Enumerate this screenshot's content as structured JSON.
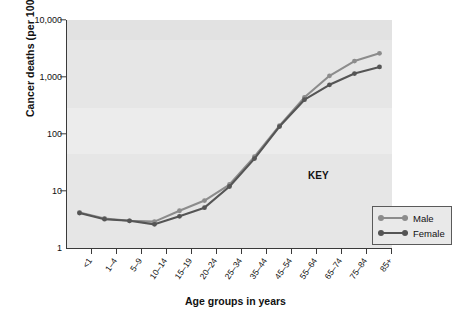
{
  "chart_data": {
    "type": "line",
    "title": "",
    "xlabel": "Age groups in years",
    "ylabel": "Cancer deaths (per 100,000)",
    "yscale": "log",
    "ylim": [
      1,
      10000
    ],
    "ytick_labels": [
      "10,000",
      "1,000",
      "100",
      "10",
      "1"
    ],
    "ytick_values": [
      10000,
      1000,
      100,
      10,
      1
    ],
    "grid": false,
    "legend_position": "inside-lower-right",
    "legend_title": "KEY",
    "categories": [
      "<1",
      "1–4",
      "5–9",
      "10–14",
      "15–19",
      "20–24",
      "25–34",
      "35–44",
      "45–54",
      "55–64",
      "65–74",
      "75–84",
      "85+"
    ],
    "series": [
      {
        "name": "Male",
        "color": "#8c8c8c",
        "values": [
          4.2,
          3.3,
          3.0,
          2.9,
          4.5,
          6.8,
          13,
          40,
          140,
          440,
          1050,
          1900,
          2600
        ]
      },
      {
        "name": "Female",
        "color": "#555555",
        "values": [
          4.1,
          3.2,
          3.0,
          2.6,
          3.6,
          5.1,
          12,
          37,
          135,
          400,
          730,
          1150,
          1500
        ]
      }
    ]
  },
  "axes": {
    "y_title": "Cancer deaths (per 100,000)",
    "x_title": "Age groups in years"
  },
  "legend": {
    "title": "KEY",
    "entries": [
      {
        "label": "Male"
      },
      {
        "label": "Female"
      }
    ]
  },
  "colors": {
    "plot_background": "#e6e6e6",
    "page_background": "#ffffff",
    "axis": "#3a3a3a",
    "male": "#8c8c8c",
    "female": "#555555",
    "text": "#111111"
  }
}
